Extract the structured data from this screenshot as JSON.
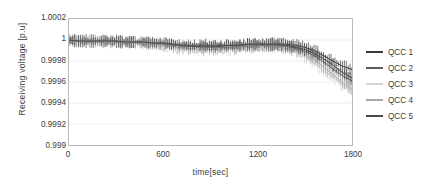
{
  "chart_data": {
    "type": "line",
    "title": "",
    "xlabel": "time[sec]",
    "ylabel": "Receiving voltage [p.u]",
    "xlim": [
      0,
      1800
    ],
    "ylim": [
      0.999,
      1.0002
    ],
    "xticks": [
      0,
      600,
      1200,
      1800
    ],
    "xtick_labels": [
      "0",
      "600",
      "1200",
      "1800"
    ],
    "yticks": [
      0.999,
      0.9992,
      0.9994,
      0.9996,
      0.9998,
      1,
      1.0002
    ],
    "ytick_labels": [
      "0.999",
      "0.9992",
      "0.9994",
      "0.9996",
      "0.9998",
      "1",
      "1.0002"
    ],
    "grid": true,
    "grid_axis": "y",
    "legend_position": "right",
    "error_bars": true,
    "x": [
      0,
      60,
      120,
      180,
      240,
      300,
      360,
      420,
      480,
      540,
      600,
      660,
      720,
      780,
      840,
      900,
      960,
      1020,
      1080,
      1140,
      1200,
      1260,
      1320,
      1380,
      1440,
      1500,
      1560,
      1620,
      1680,
      1740,
      1800
    ],
    "series": [
      {
        "name": "QCC 1",
        "color": "#3a3a3a",
        "values": [
          1.0,
          0.99999,
          0.99999,
          0.99999,
          0.99999,
          0.99999,
          0.99998,
          0.99998,
          0.99998,
          0.99997,
          0.99997,
          0.99996,
          0.99995,
          0.99995,
          0.99995,
          0.99995,
          0.99995,
          0.99995,
          0.99995,
          0.99996,
          0.99996,
          0.99996,
          0.99996,
          0.99996,
          0.99995,
          0.99993,
          0.9999,
          0.99985,
          0.9998,
          0.99975,
          0.99972
        ]
      },
      {
        "name": "QCC 2",
        "color": "#5c5c5c",
        "values": [
          1.0,
          0.99999,
          0.99999,
          0.99999,
          0.99999,
          0.99998,
          0.99998,
          0.99998,
          0.99998,
          0.99997,
          0.99996,
          0.99995,
          0.99994,
          0.99994,
          0.99993,
          0.99993,
          0.99993,
          0.99993,
          0.99994,
          0.99994,
          0.99995,
          0.99995,
          0.99995,
          0.99994,
          0.99992,
          0.99989,
          0.99985,
          0.99979,
          0.99972,
          0.99966,
          0.99961
        ]
      },
      {
        "name": "QCC 3",
        "color": "#d4d4d4",
        "values": [
          1.0,
          0.99999,
          0.99999,
          0.99999,
          0.99998,
          0.99998,
          0.99998,
          0.99997,
          0.99997,
          0.99996,
          0.99995,
          0.99993,
          0.99992,
          0.99991,
          0.99991,
          0.99991,
          0.99991,
          0.99991,
          0.99992,
          0.99992,
          0.99993,
          0.99993,
          0.99992,
          0.99991,
          0.99988,
          0.99984,
          0.99978,
          0.99971,
          0.99964,
          0.99957,
          0.99951
        ]
      },
      {
        "name": "QCC 4",
        "color": "#a9a9a9",
        "values": [
          1.0,
          0.99999,
          0.99999,
          0.99999,
          0.99999,
          0.99998,
          0.99998,
          0.99998,
          0.99997,
          0.99996,
          0.99995,
          0.99994,
          0.99992,
          0.99992,
          0.99991,
          0.99991,
          0.99991,
          0.99992,
          0.99992,
          0.99993,
          0.99993,
          0.99994,
          0.99993,
          0.99992,
          0.9999,
          0.99986,
          0.99981,
          0.99974,
          0.99967,
          0.99959,
          0.99953
        ]
      },
      {
        "name": "QCC 5",
        "color": "#4a4a4a",
        "values": [
          1.0,
          0.99999,
          0.99999,
          0.99999,
          0.99999,
          0.99999,
          0.99998,
          0.99998,
          0.99998,
          0.99997,
          0.99997,
          0.99996,
          0.99995,
          0.99994,
          0.99994,
          0.99994,
          0.99994,
          0.99995,
          0.99995,
          0.99996,
          0.99996,
          0.99996,
          0.99996,
          0.99995,
          0.99993,
          0.99991,
          0.99987,
          0.99982,
          0.99976,
          0.99969,
          0.99964
        ]
      }
    ]
  }
}
